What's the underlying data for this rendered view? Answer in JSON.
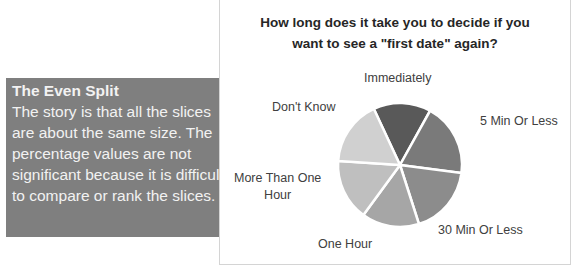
{
  "callout": {
    "title": "The Even Split",
    "body": "The story is that all the slices are about the same size.  The percentage values are not significant because it is difficult to compare or rank the slices.",
    "background_color": "#7f7f7f",
    "text_color": "#f2f2f2"
  },
  "chart": {
    "title_line1": "How long does it take you to decide if you",
    "title_line2": "want to see a \"first date\" again?",
    "labels": {
      "immediately": "Immediately",
      "five_min": "5 Min Or Less",
      "thirty_min": "30 Min Or Less",
      "one_hour": "One Hour",
      "more_than_one_hour_l1": "More Than One",
      "more_than_one_hour_l2": "Hour",
      "dont_know": "Don't Know"
    }
  },
  "chart_data": {
    "type": "pie",
    "title": "How long does it take you to decide if you want to see a \"first date\" again?",
    "categories": [
      "Immediately",
      "5 Min Or Less",
      "30 Min Or Less",
      "One Hour",
      "More Than One Hour",
      "Don't Know"
    ],
    "values": [
      15,
      19,
      18,
      15,
      16,
      17
    ],
    "colors": [
      "#595959",
      "#7a7a7a",
      "#8c8c8c",
      "#a6a6a6",
      "#bfbfbf",
      "#d0d0d0"
    ],
    "legend": "none (category labels placed outside slices)",
    "data_labels": false,
    "note": "Values estimated from slice angles; no percentages shown in the figure"
  }
}
